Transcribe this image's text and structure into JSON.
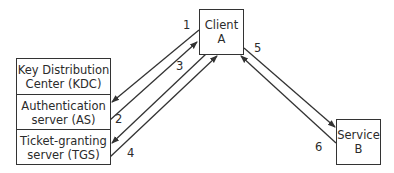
{
  "kdc": {
    "title": "Key Distribution\nCenter (KDC)",
    "as": "Authentication\nserver (AS)",
    "tgs": "Ticket-granting\nserver (TGS)"
  },
  "client": {
    "label": "Client\nA"
  },
  "service": {
    "label": "Service\nB"
  },
  "steps": [
    "1",
    "2",
    "3",
    "4",
    "5",
    "6"
  ],
  "colors": {
    "line": "#333333"
  }
}
